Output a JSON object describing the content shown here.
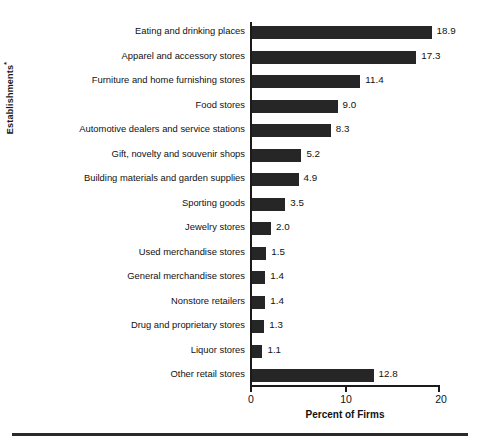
{
  "chart_data": {
    "type": "bar",
    "orientation": "horizontal",
    "title": "",
    "xlabel": "Percent of Firms",
    "ylabel": "Establishments",
    "ylabel_superscript": "*",
    "xlim": [
      0,
      20
    ],
    "xticks": [
      "0",
      "10",
      "20"
    ],
    "xtick_values": [
      0,
      10,
      20
    ],
    "grid": false,
    "legend": false,
    "bar_color": "#262626",
    "axis_color": "#1a1a1a",
    "categories": [
      "Eating and drinking places",
      "Apparel and accessory stores",
      "Furniture and home furnishing stores",
      "Food stores",
      "Automotive dealers and service stations",
      "Gift, novelty and souvenir shops",
      "Building materials and garden supplies",
      "Sporting goods",
      "Jewelry stores",
      "Used merchandise stores",
      "General merchandise stores",
      "Nonstore retailers",
      "Drug and proprietary stores",
      "Liquor stores",
      "Other retail stores"
    ],
    "values": [
      18.9,
      17.3,
      11.4,
      9.0,
      8.3,
      5.2,
      4.9,
      3.5,
      2.0,
      1.5,
      1.4,
      1.4,
      1.3,
      1.1,
      12.8
    ],
    "value_labels": [
      "18.9",
      "17.3",
      "11.4",
      "9.0",
      "8.3",
      "5.2",
      "4.9",
      "3.5",
      "2.0",
      "1.5",
      "1.4",
      "1.4",
      "1.3",
      "1.1",
      "12.8"
    ]
  }
}
